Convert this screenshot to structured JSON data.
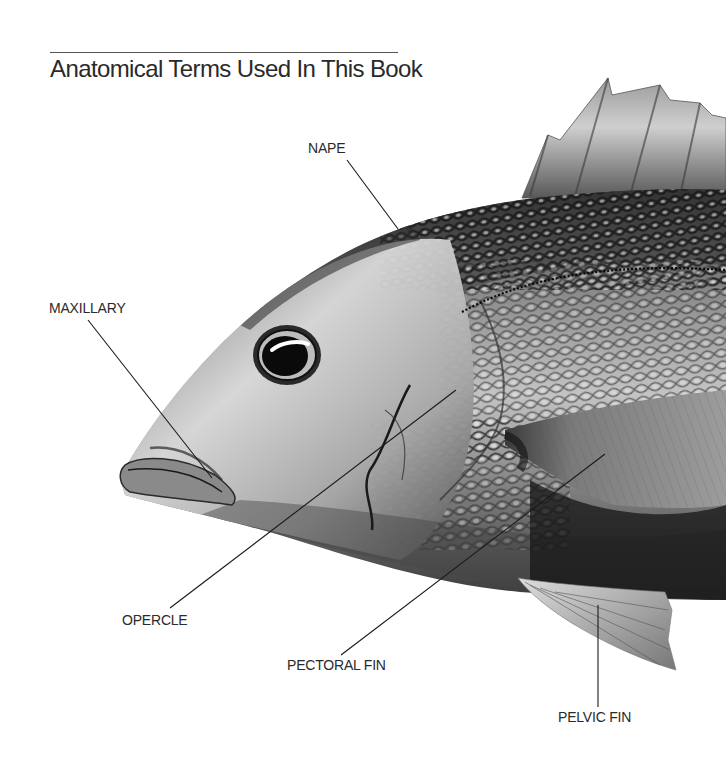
{
  "page": {
    "title": "Anatomical Terms Used In This Book"
  },
  "figure": {
    "labels": [
      {
        "id": "nape",
        "text": "NAPE"
      },
      {
        "id": "maxillary",
        "text": "MAXILLARY"
      },
      {
        "id": "opercle",
        "text": "OPERCLE"
      },
      {
        "id": "pectoral_fin",
        "text": "PECTORAL FIN"
      },
      {
        "id": "pelvic_fin",
        "text": "PELVIC FIN"
      }
    ]
  },
  "colors": {
    "background": "#ffffff",
    "text": "#2a2a2a",
    "leader_line": "#1a1a1a"
  }
}
